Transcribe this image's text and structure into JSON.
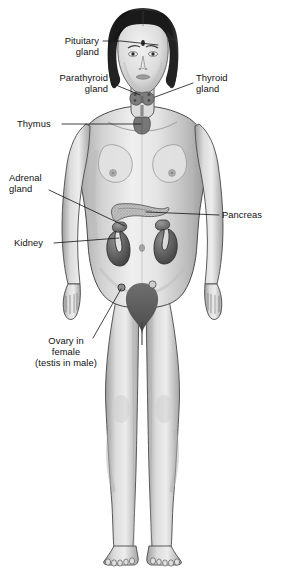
{
  "diagram": {
    "background_color": "#ffffff",
    "line_color": "#111111",
    "label_font_size_px": 9.4,
    "style": "grayscale halftone medical illustration"
  },
  "labels": [
    {
      "id": "pituitary",
      "name": "pituitary-gland-label",
      "lines": [
        "Pituitary",
        "gland"
      ],
      "align": "right",
      "text_x": 99,
      "text_y": 44,
      "line_height": 11,
      "leader": "M103,41 L121,41 L158,45",
      "target": "brain base / forehead"
    },
    {
      "id": "parathyroid",
      "name": "parathyroid-gland-label",
      "lines": [
        "Parathyroid",
        "gland"
      ],
      "align": "right",
      "text_x": 108,
      "text_y": 81,
      "line_height": 11,
      "leader": "M111,83 L140,95",
      "target": "behind thyroid at neck"
    },
    {
      "id": "thyroid",
      "name": "thyroid-gland-label",
      "lines": [
        "Thyroid",
        "gland"
      ],
      "align": "left",
      "text_x": 196,
      "text_y": 81,
      "line_height": 11,
      "leader": "M193,83 L155,97",
      "target": "front of neck"
    },
    {
      "id": "thymus",
      "name": "thymus-label",
      "lines": [
        "Thymus"
      ],
      "align": "left",
      "text_x": 17,
      "text_y": 127,
      "line_height": 11,
      "leader": "M62,124 L141,124",
      "target": "upper chest behind sternum"
    },
    {
      "id": "adrenal",
      "name": "adrenal-gland-label",
      "lines": [
        "Adrenal",
        "gland"
      ],
      "align": "left",
      "text_x": 9,
      "text_y": 181,
      "line_height": 11,
      "leader": "M49,190 L125,226",
      "target": "top of kidney"
    },
    {
      "id": "pancreas",
      "name": "pancreas-label",
      "lines": [
        "Pancreas"
      ],
      "align": "left",
      "text_x": 222,
      "text_y": 218,
      "line_height": 11,
      "leader": "M219,215 L146,212",
      "target": "upper abdomen behind stomach"
    },
    {
      "id": "kidney",
      "name": "kidney-label",
      "lines": [
        "Kidney"
      ],
      "align": "left",
      "text_x": 14,
      "text_y": 246,
      "line_height": 11,
      "leader": "M54,243 L119,238",
      "target": "lower back, both sides of spine"
    },
    {
      "id": "ovary",
      "name": "ovary-testis-label",
      "lines": [
        "Ovary in",
        "female",
        "(testis in male)"
      ],
      "align": "center",
      "text_x": 66,
      "text_y": 344,
      "line_height": 11,
      "leader": "M93,338 L121,289",
      "target": "pelvis, both sides of uterus"
    }
  ],
  "organs": [
    {
      "id": "pituitary-gland",
      "name": "pituitary-gland-shape",
      "label_ref": "pituitary"
    },
    {
      "id": "thyroid-gland",
      "name": "thyroid-gland-shape",
      "label_ref": "thyroid"
    },
    {
      "id": "parathyroid-gland",
      "name": "parathyroid-gland-shape",
      "label_ref": "parathyroid"
    },
    {
      "id": "thymus",
      "name": "thymus-shape",
      "label_ref": "thymus"
    },
    {
      "id": "pancreas",
      "name": "pancreas-shape",
      "label_ref": "pancreas"
    },
    {
      "id": "adrenal-gland-left",
      "name": "adrenal-gland-shape",
      "label_ref": "adrenal"
    },
    {
      "id": "adrenal-gland-right",
      "name": "adrenal-gland-shape",
      "label_ref": "adrenal"
    },
    {
      "id": "kidney-left",
      "name": "kidney-shape",
      "label_ref": "kidney"
    },
    {
      "id": "kidney-right",
      "name": "kidney-shape",
      "label_ref": "kidney"
    },
    {
      "id": "ovary-left",
      "name": "ovary-shape",
      "label_ref": "ovary"
    },
    {
      "id": "ovary-right",
      "name": "ovary-shape",
      "label_ref": "ovary"
    }
  ],
  "colors": {
    "background": "#ffffff",
    "outline": "#3a3a3a",
    "skin_light": "#efefef",
    "skin_mid": "#c9c9c9",
    "skin_shadow": "#9a9a9a",
    "hair_dark": "#1c1c1c",
    "hair_mid": "#3d3d3d",
    "organ_dark": "#5a5a5a",
    "organ_mid": "#8b8b8b",
    "text": "#111111"
  }
}
